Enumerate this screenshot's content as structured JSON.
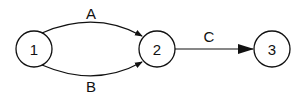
{
  "diagram": {
    "type": "directed-graph",
    "nodes": [
      {
        "id": "1",
        "label": "1"
      },
      {
        "id": "2",
        "label": "2"
      },
      {
        "id": "3",
        "label": "3"
      }
    ],
    "edges": [
      {
        "from": "1",
        "to": "2",
        "label": "A",
        "style": "curved-upper"
      },
      {
        "from": "1",
        "to": "2",
        "label": "B",
        "style": "curved-lower"
      },
      {
        "from": "2",
        "to": "3",
        "label": "C",
        "style": "straight"
      }
    ],
    "colors": {
      "stroke": "#111111",
      "background": "#ffffff"
    }
  }
}
